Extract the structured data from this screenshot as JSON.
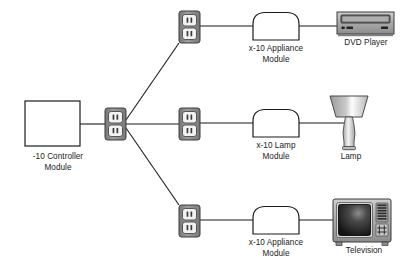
{
  "diagram": {
    "background_color": "#ffffff",
    "line_color": "#1b1b1b",
    "device_fill": "#a8a8a8",
    "device_stroke": "#3a3a3a",
    "outlet_body_color": "#8c8c8c",
    "outlet_face_color": "#f2f2f2",
    "screen_color": "#1a1a1a",
    "nodes": [
      {
        "id": "controller",
        "type": "controller-box",
        "label": "-10 Controller\nModule",
        "x": 25,
        "y": 101,
        "width": 55,
        "height": 45
      },
      {
        "id": "outlet-main",
        "type": "outlet",
        "label": "",
        "x": 105,
        "y": 108,
        "width": 21,
        "height": 32
      },
      {
        "id": "outlet-top",
        "type": "outlet",
        "label": "",
        "x": 179,
        "y": 11,
        "width": 21,
        "height": 32
      },
      {
        "id": "outlet-middle",
        "type": "outlet",
        "label": "",
        "x": 179,
        "y": 108,
        "width": 21,
        "height": 32
      },
      {
        "id": "outlet-bottom",
        "type": "outlet",
        "label": "",
        "x": 179,
        "y": 205,
        "width": 21,
        "height": 32
      },
      {
        "id": "module-top",
        "type": "module",
        "label": "x-10 Appliance\nModule",
        "x": 253,
        "y": 12,
        "width": 46,
        "height": 28
      },
      {
        "id": "module-middle",
        "type": "module",
        "label": "x-10 Lamp\nModule",
        "x": 253,
        "y": 109,
        "width": 46,
        "height": 28
      },
      {
        "id": "module-bottom",
        "type": "module",
        "label": "x-10 Appliance\nModule",
        "x": 253,
        "y": 206,
        "width": 46,
        "height": 28
      },
      {
        "id": "dvd-player",
        "type": "dvd",
        "label": "DVD Player",
        "x": 337,
        "y": 12,
        "width": 57,
        "height": 22
      },
      {
        "id": "lamp",
        "type": "lamp",
        "label": "Lamp",
        "x": 326,
        "y": 94,
        "width": 46,
        "height": 56
      },
      {
        "id": "television",
        "type": "tv",
        "label": "Television",
        "x": 333,
        "y": 199,
        "width": 58,
        "height": 46
      }
    ],
    "connections": [
      {
        "id": "controller-to-main-outlet",
        "from": "controller",
        "to": "outlet-main"
      },
      {
        "id": "main-outlet-to-top-outlet",
        "from": "outlet-main",
        "to": "outlet-top"
      },
      {
        "id": "main-outlet-to-middle-outlet",
        "from": "outlet-main",
        "to": "outlet-middle"
      },
      {
        "id": "main-outlet-to-bottom-outlet",
        "from": "outlet-main",
        "to": "outlet-bottom"
      },
      {
        "id": "top-outlet-to-module",
        "from": "outlet-top",
        "to": "module-top"
      },
      {
        "id": "top-module-to-dvd",
        "from": "module-top",
        "to": "dvd-player"
      },
      {
        "id": "middle-outlet-to-module",
        "from": "outlet-middle",
        "to": "module-middle"
      },
      {
        "id": "middle-module-to-lamp",
        "from": "module-middle",
        "to": "lamp"
      },
      {
        "id": "bottom-outlet-to-module",
        "from": "outlet-bottom",
        "to": "module-bottom"
      },
      {
        "id": "bottom-module-to-tv",
        "from": "module-bottom",
        "to": "television"
      }
    ],
    "labels": {
      "controller": "-10 Controller\nModule",
      "module_top": "x-10 Appliance\nModule",
      "module_middle": "x-10 Lamp\nModule",
      "module_bottom": "x-10 Appliance\nModule",
      "dvd": "DVD Player",
      "lamp": "Lamp",
      "tv": "Television"
    }
  }
}
